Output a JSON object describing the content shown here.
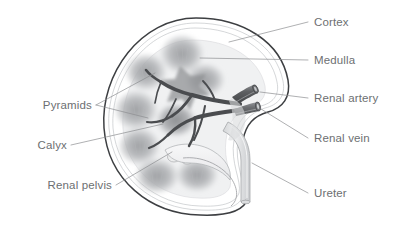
{
  "figure": {
    "background_color": "#ffffff",
    "label_color": "#6d6f72",
    "leader_color": "#8c8e91",
    "outline_color": "#3d3f42"
  },
  "labels": [
    {
      "id": "cortex",
      "text": "Cortex",
      "side": "right"
    },
    {
      "id": "medulla",
      "text": "Medulla",
      "side": "right"
    },
    {
      "id": "renal-artery",
      "text": "Renal artery",
      "side": "right"
    },
    {
      "id": "renal-vein",
      "text": "Renal vein",
      "side": "right"
    },
    {
      "id": "ureter",
      "text": "Ureter",
      "side": "right"
    },
    {
      "id": "pyramids",
      "text": "Pyramids",
      "side": "left"
    },
    {
      "id": "calyx",
      "text": "Calyx",
      "side": "left"
    },
    {
      "id": "renal-pelvis",
      "text": "Renal pelvis",
      "side": "left"
    }
  ],
  "structures": {
    "capsule": "outer kidney capsule",
    "cortex_band": "cortex outer band",
    "medulla_region": "medulla inner region",
    "pyramids_count": 8,
    "renal_artery": "renal artery tube",
    "renal_vein": "renal vein tube",
    "ureter": "ureter tube",
    "renal_pelvis": "renal pelvis basin",
    "calyces": "minor and major calyces"
  }
}
